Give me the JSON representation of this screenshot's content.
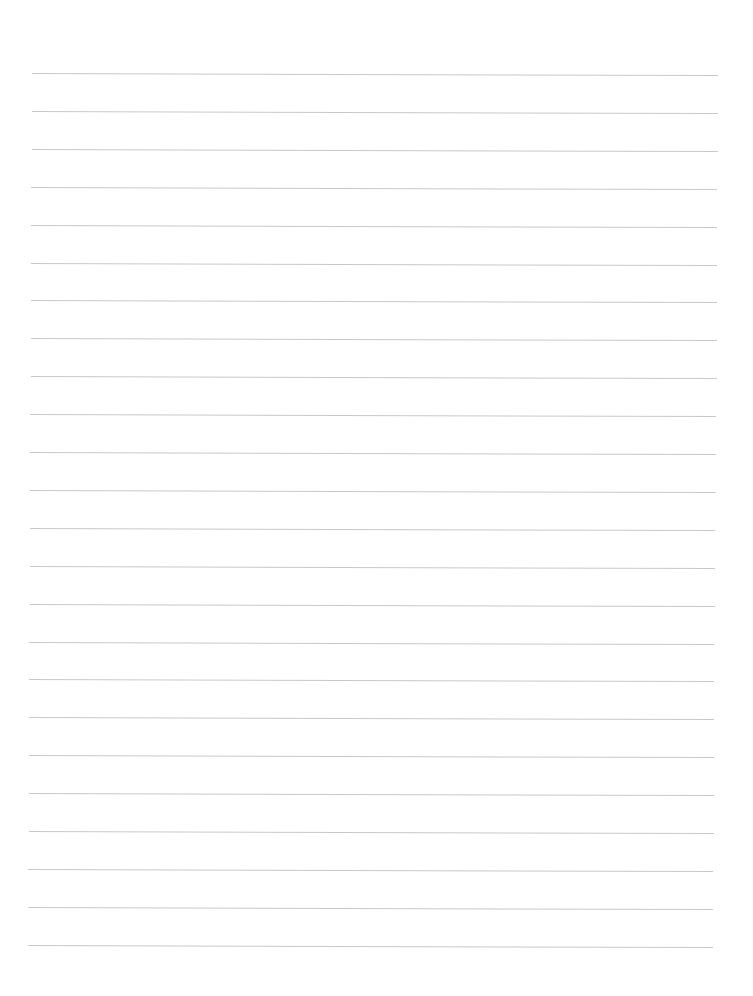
{
  "page": {
    "type": "blank lined paper",
    "background_color": "#ffffff",
    "line_color": "#c9c9c9",
    "line_count": 24,
    "first_line_y": 73,
    "line_spacing": 37.9,
    "line_left_top": 32,
    "line_right_top": 718,
    "line_left_bottom": 28,
    "line_right_bottom": 713,
    "tilt_px": 2,
    "text": ""
  }
}
